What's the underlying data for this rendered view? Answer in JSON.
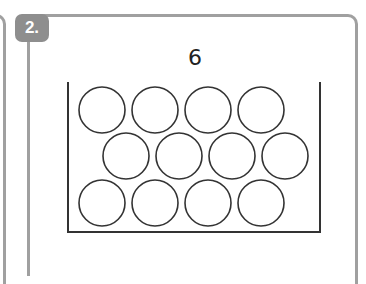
{
  "exercise": {
    "number_label": "2.",
    "target_number": "6"
  },
  "tray": {
    "rows": [
      {
        "count": 4,
        "offset": "left"
      },
      {
        "count": 4,
        "offset": "right"
      },
      {
        "count": 4,
        "offset": "left"
      }
    ],
    "total_circles": 12,
    "filled_circles": 0
  },
  "colors": {
    "border": "#a0a0a0",
    "badge": "#8e8e8e",
    "ink": "#222222"
  }
}
